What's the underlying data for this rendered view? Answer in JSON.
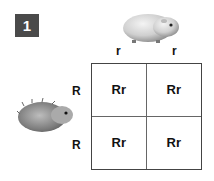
{
  "badge": {
    "label": "1",
    "color": "#4a4a4a"
  },
  "top_parent": {
    "icon": "smooth-guinea-pig-icon",
    "alleles": [
      "r",
      "r"
    ]
  },
  "left_parent": {
    "icon": "rough-guinea-pig-icon",
    "alleles": [
      "R",
      "R"
    ]
  },
  "punnett": {
    "cells": [
      [
        "Rr",
        "Rr"
      ],
      [
        "Rr",
        "Rr"
      ]
    ]
  }
}
